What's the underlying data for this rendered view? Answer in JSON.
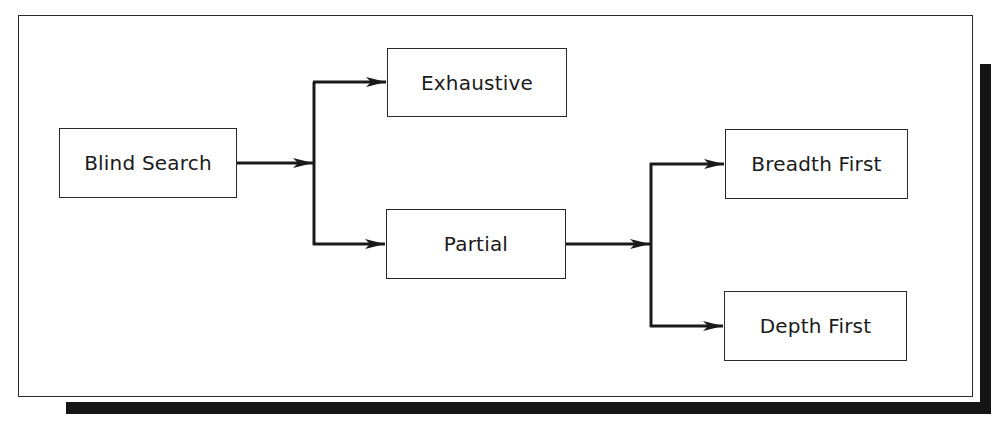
{
  "diagram": {
    "title": "",
    "colors": {
      "line": "#1a1a1a",
      "shadow": "#141414",
      "background": "#ffffff"
    },
    "nodes": [
      {
        "id": "blind_search",
        "label": "Blind Search",
        "x": 59,
        "y": 128,
        "w": 178,
        "h": 70
      },
      {
        "id": "exhaustive",
        "label": "Exhaustive",
        "x": 387,
        "y": 48,
        "w": 180,
        "h": 69
      },
      {
        "id": "partial",
        "label": "Partial",
        "x": 386,
        "y": 209,
        "w": 180,
        "h": 70
      },
      {
        "id": "breadth_first",
        "label": "Breadth First",
        "x": 725,
        "y": 129,
        "w": 183,
        "h": 70
      },
      {
        "id": "depth_first",
        "label": "Depth First",
        "x": 724,
        "y": 291,
        "w": 183,
        "h": 70
      }
    ],
    "edges": [
      {
        "from": "blind_search",
        "to": "exhaustive"
      },
      {
        "from": "blind_search",
        "to": "partial"
      },
      {
        "from": "partial",
        "to": "breadth_first"
      },
      {
        "from": "partial",
        "to": "depth_first"
      }
    ]
  }
}
